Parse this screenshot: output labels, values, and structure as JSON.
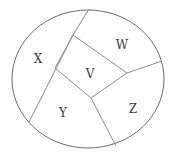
{
  "figure": {
    "name": "partitioned-ellipse-diagram",
    "background_color": "#ffffff",
    "outline_color": "#6a6a6a",
    "line_color": "#8c8c8c",
    "label_color": "#3a3a3a"
  },
  "chart_data": {
    "type": "diagram",
    "title": "",
    "subtitle": "",
    "xlabel": "",
    "ylabel": "",
    "grid": false,
    "legend": false,
    "canvas": {
      "width": 176,
      "height": 158
    },
    "ellipse": {
      "cx": 88,
      "cy": 79,
      "rx": 76,
      "ry": 69
    },
    "central_quad": {
      "name": "V",
      "vertices": [
        {
          "x": 73,
          "y": 35
        },
        {
          "x": 127,
          "y": 73
        },
        {
          "x": 91,
          "y": 98
        },
        {
          "x": 55,
          "y": 68
        }
      ]
    },
    "chords": [
      {
        "name": "top-chord",
        "from": {
          "x": 73,
          "y": 35
        },
        "to": {
          "x": 89,
          "y": 9
        }
      },
      {
        "name": "left-long-chord",
        "from": {
          "x": 73,
          "y": 35
        },
        "to": {
          "x": 29,
          "y": 122
        }
      },
      {
        "name": "right-chord",
        "from": {
          "x": 127,
          "y": 73
        },
        "to": {
          "x": 162,
          "y": 61
        }
      },
      {
        "name": "bottom-chord",
        "from": {
          "x": 91,
          "y": 98
        },
        "to": {
          "x": 116,
          "y": 146
        }
      }
    ],
    "regions": [
      {
        "id": "X",
        "label": "X",
        "label_x": 38,
        "label_y": 59
      },
      {
        "id": "W",
        "label": "W",
        "label_x": 122,
        "label_y": 45
      },
      {
        "id": "V",
        "label": "V",
        "label_x": 90,
        "label_y": 74
      },
      {
        "id": "Y",
        "label": "Y",
        "label_x": 63,
        "label_y": 113
      },
      {
        "id": "Z",
        "label": "Z",
        "label_x": 133,
        "label_y": 109
      }
    ]
  }
}
